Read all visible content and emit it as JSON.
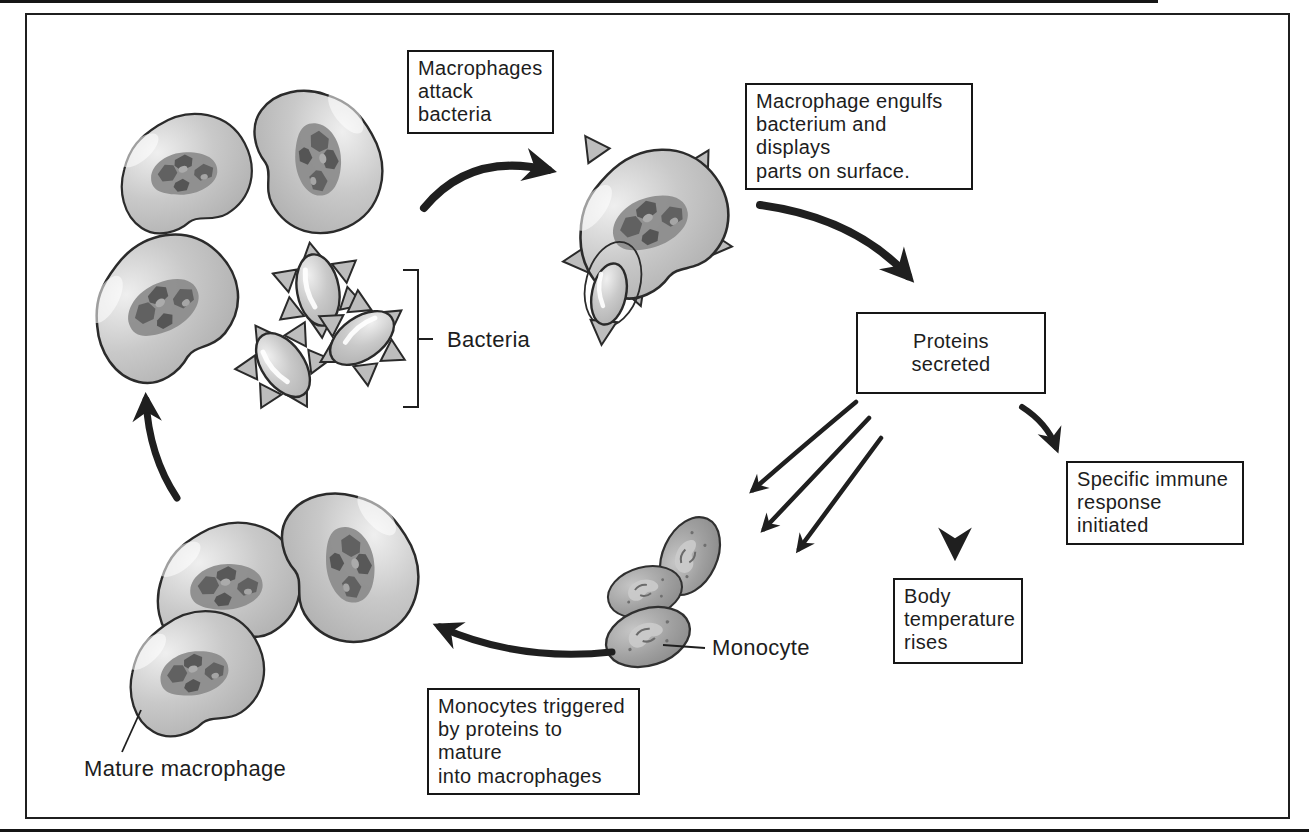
{
  "callouts": {
    "macrophages_attack": "Macrophages\nattack\nbacteria",
    "macrophage_engulfs": "Macrophage engulfs\nbacterium and displays\nparts on surface.",
    "proteins_secreted": "Proteins\nsecreted",
    "specific_immune": "Specific immune\nresponse initiated",
    "body_temperature": "Body\ntemperature\nrises",
    "monocytes_triggered": "Monocytes triggered\nby proteins to mature\ninto macrophages"
  },
  "labels": {
    "bacteria": "Bacteria",
    "monocyte": "Monocyte",
    "mature_macrophage": "Mature macrophage"
  },
  "colors": {
    "background": "#ffffff",
    "frame_border": "#1f1f1f",
    "box_border": "#161616",
    "text": "#1d1d1d",
    "cell_body": "#c6c6c6",
    "cell_highlight": "#eeeeee",
    "cell_outline": "#2b2b2b",
    "nucleus": "#8b8b8b",
    "nucleus_dark": "#5d5d5d",
    "monocyte_body": "#9c9c9c",
    "arrow": "#1f1f1f"
  }
}
